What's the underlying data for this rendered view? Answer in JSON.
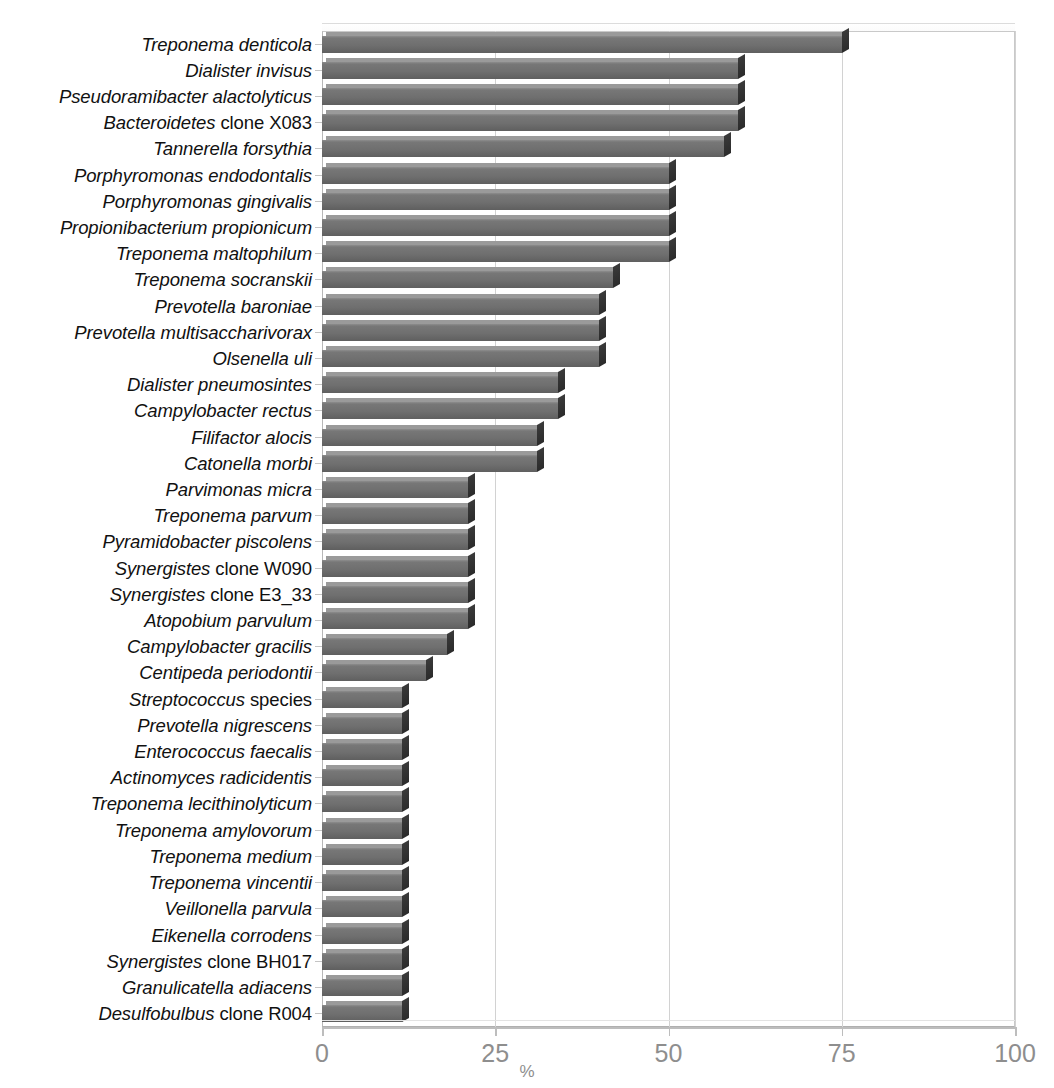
{
  "chart_data": {
    "type": "bar",
    "orientation": "horizontal",
    "title": "",
    "subtitle": "",
    "xlabel": "%",
    "ylabel": "",
    "xlim": [
      0,
      100
    ],
    "xticks": [
      0,
      25,
      50,
      75,
      100
    ],
    "xtick_labels": [
      "0",
      "25",
      "50",
      "75",
      "100"
    ],
    "grid": true,
    "grid_axis": "x",
    "legend": false,
    "legend_position": "none",
    "bar_color": "#6f6f6f",
    "bar_edge_color": "#2b2b2b",
    "categories": [
      "Treponema denticola",
      "Dialister invisus",
      "Pseudoramibacter alactolyticus",
      "Bacteroidetes clone X083",
      "Tannerella forsythia",
      "Porphyromonas endodontalis",
      "Porphyromonas gingivalis",
      "Propionibacterium propionicum",
      "Treponema maltophilum",
      "Treponema socranskii",
      "Prevotella baroniae",
      "Prevotella multisaccharivorax",
      "Olsenella uli",
      "Dialister pneumosintes",
      "Campylobacter rectus",
      "Filifactor alocis",
      "Catonella morbi",
      "Parvimonas micra",
      "Treponema parvum",
      "Pyramidobacter piscolens",
      "Synergistes clone W090",
      "Synergistes clone E3_33",
      "Atopobium parvulum",
      "Campylobacter gracilis",
      "Centipeda periodontii",
      "Streptococcus species",
      "Prevotella nigrescens",
      "Enterococcus faecalis",
      "Actinomyces radicidentis",
      "Treponema lecithinolyticum",
      "Treponema amylovorum",
      "Treponema medium",
      "Treponema vincentii",
      "Veillonella parvula",
      "Eikenella corrodens",
      "Synergistes clone BH017",
      "Granulicatella adiacens",
      "Desulfobulbus clone R004"
    ],
    "category_label_parts": [
      {
        "italic": "Treponema denticola",
        "roman": ""
      },
      {
        "italic": "Dialister invisus",
        "roman": ""
      },
      {
        "italic": "Pseudoramibacter alactolyticus",
        "roman": ""
      },
      {
        "italic": "Bacteroidetes",
        "roman": " clone X083"
      },
      {
        "italic": "Tannerella forsythia",
        "roman": ""
      },
      {
        "italic": "Porphyromonas endodontalis",
        "roman": ""
      },
      {
        "italic": "Porphyromonas gingivalis",
        "roman": ""
      },
      {
        "italic": "Propionibacterium propionicum",
        "roman": ""
      },
      {
        "italic": "Treponema maltophilum",
        "roman": ""
      },
      {
        "italic": "Treponema socranskii",
        "roman": ""
      },
      {
        "italic": "Prevotella baroniae",
        "roman": ""
      },
      {
        "italic": "Prevotella multisaccharivorax",
        "roman": ""
      },
      {
        "italic": "Olsenella uli",
        "roman": ""
      },
      {
        "italic": "Dialister pneumosintes",
        "roman": ""
      },
      {
        "italic": "Campylobacter rectus",
        "roman": ""
      },
      {
        "italic": "Filifactor alocis",
        "roman": ""
      },
      {
        "italic": "Catonella morbi",
        "roman": ""
      },
      {
        "italic": "Parvimonas micra",
        "roman": ""
      },
      {
        "italic": "Treponema parvum",
        "roman": ""
      },
      {
        "italic": "Pyramidobacter piscolens",
        "roman": ""
      },
      {
        "italic": "Synergistes",
        "roman": " clone W090"
      },
      {
        "italic": "Synergistes",
        "roman": " clone E3_33"
      },
      {
        "italic": "Atopobium parvulum",
        "roman": ""
      },
      {
        "italic": "Campylobacter gracilis",
        "roman": ""
      },
      {
        "italic": "Centipeda periodontii",
        "roman": ""
      },
      {
        "italic": "Streptococcus",
        "roman": " species"
      },
      {
        "italic": "Prevotella nigrescens",
        "roman": ""
      },
      {
        "italic": "Enterococcus faecalis",
        "roman": ""
      },
      {
        "italic": "Actinomyces radicidentis",
        "roman": ""
      },
      {
        "italic": "Treponema lecithinolyticum",
        "roman": ""
      },
      {
        "italic": "Treponema amylovorum",
        "roman": ""
      },
      {
        "italic": "Treponema medium",
        "roman": ""
      },
      {
        "italic": "Treponema vincentii",
        "roman": ""
      },
      {
        "italic": "Veillonella parvula",
        "roman": ""
      },
      {
        "italic": "Eikenella corrodens",
        "roman": ""
      },
      {
        "italic": "Synergistes",
        "roman": " clone BH017"
      },
      {
        "italic": "Granulicatella adiacens",
        "roman": ""
      },
      {
        "italic": "Desulfobulbus",
        "roman": " clone R004"
      }
    ],
    "values": [
      75,
      60,
      60,
      60,
      58,
      50,
      50,
      50,
      50,
      42,
      40,
      40,
      40,
      34,
      34,
      31,
      31,
      21,
      21,
      21,
      21,
      21,
      21,
      18,
      15,
      11.5,
      11.5,
      11.5,
      11.5,
      11.5,
      11.5,
      11.5,
      11.5,
      11.5,
      11.5,
      11.5,
      11.5,
      11.5
    ]
  }
}
